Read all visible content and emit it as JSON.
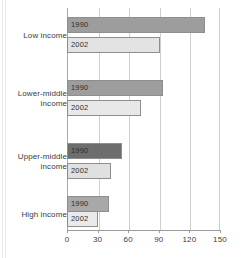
{
  "chart_data": {
    "type": "bar",
    "orientation": "horizontal",
    "title": "",
    "subtitle": "",
    "xlabel": "",
    "ylabel": "",
    "xlim": [
      0,
      150
    ],
    "xticks": [
      0,
      30,
      60,
      90,
      120,
      150
    ],
    "xtick_labels": [
      "0",
      "30",
      "60",
      "90",
      "120",
      "150"
    ],
    "grid": true,
    "legend": "in-bar labels",
    "categories": [
      "Low income",
      "Lower-middle income",
      "Upper-middle income",
      "High income"
    ],
    "series": [
      {
        "name": "1990",
        "values": [
          135,
          94,
          54,
          41
        ],
        "color": "#9d9d9d"
      },
      {
        "name": "2002",
        "values": [
          91,
          73,
          43,
          30
        ],
        "color": "#e3e3e3"
      }
    ],
    "bars": [
      {
        "category": "Low income",
        "series": "1990",
        "value": 135,
        "label": "1990",
        "color": "#9d9d9d",
        "top": 17
      },
      {
        "category": "Low income",
        "series": "2002",
        "value": 91,
        "label": "2002",
        "color": "#e3e3e3",
        "top": 37
      },
      {
        "category": "Lower-middle income",
        "series": "1990",
        "value": 94,
        "label": "1990",
        "color": "#9d9d9d",
        "top": 80
      },
      {
        "category": "Lower-middle income",
        "series": "2002",
        "value": 73,
        "label": "2002",
        "color": "#e8e8e8",
        "top": 100
      },
      {
        "category": "Upper-middle income",
        "series": "1990",
        "value": 54,
        "label": "1990",
        "color": "#6d6d6d",
        "top": 143
      },
      {
        "category": "Upper-middle income",
        "series": "2002",
        "value": 43,
        "label": "2002",
        "color": "#e0e0e0",
        "top": 163
      },
      {
        "category": "High income",
        "series": "1990",
        "value": 41,
        "label": "1990",
        "color": "#a8a8a8",
        "top": 196
      },
      {
        "category": "High income",
        "series": "2002",
        "value": 30,
        "label": "2002",
        "color": "#eaeaea",
        "top": 211
      }
    ],
    "category_labels": [
      {
        "line1": "Low income",
        "line2": "",
        "top": 31
      },
      {
        "line1": "Lower-middle",
        "line2": "income",
        "top": 89
      },
      {
        "line1": "Upper-middle",
        "line2": "income",
        "top": 152
      },
      {
        "line1": "High income",
        "line2": "",
        "top": 210
      }
    ],
    "colors": {
      "series_1990": "#9d9d9d",
      "series_2002": "#e3e3e3",
      "bar_border": "#8e8e8e",
      "gridline": "#cfcfcf",
      "axis": "#9a9a9a",
      "text": "#3b3b3b",
      "background": "#ffffff"
    }
  }
}
